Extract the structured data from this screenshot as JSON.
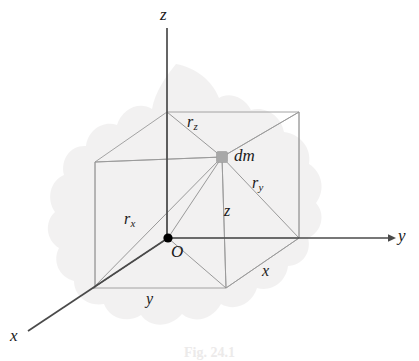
{
  "figure": {
    "kind": "3d-coordinate-diagram",
    "background_color": "#ffffff",
    "line_color": "#6b6b6b",
    "axis_color": "#4a4a4a",
    "blob_color": "#f1f0f0",
    "dm_marker_color": "#a8a8a8",
    "origin_marker_color": "#000000",
    "text_color": "#1a1a1a"
  },
  "axes": {
    "z": {
      "label": "z",
      "x": 160,
      "y": 6
    },
    "y": {
      "label": "y",
      "x": 398,
      "y": 227
    },
    "x": {
      "label": "x",
      "x": 10,
      "y": 327
    }
  },
  "points": {
    "origin": {
      "label": "O",
      "x": 171,
      "y": 243
    },
    "mass_element": {
      "label": "dm",
      "x": 234,
      "y": 147
    }
  },
  "segments": {
    "r_x": {
      "base": "r",
      "sub": "x",
      "x": 124,
      "y": 211
    },
    "r_y": {
      "base": "r",
      "sub": "y",
      "x": 252,
      "y": 175
    },
    "r_z": {
      "base": "r",
      "sub": "z",
      "x": 187,
      "y": 114
    },
    "edge_x": {
      "label": "x",
      "x": 262,
      "y": 263
    },
    "edge_y": {
      "label": "y",
      "x": 146,
      "y": 291
    },
    "edge_z": {
      "label": "z",
      "x": 224,
      "y": 203
    }
  },
  "caption": {
    "text": "Fig. 24.1",
    "y": 345
  }
}
